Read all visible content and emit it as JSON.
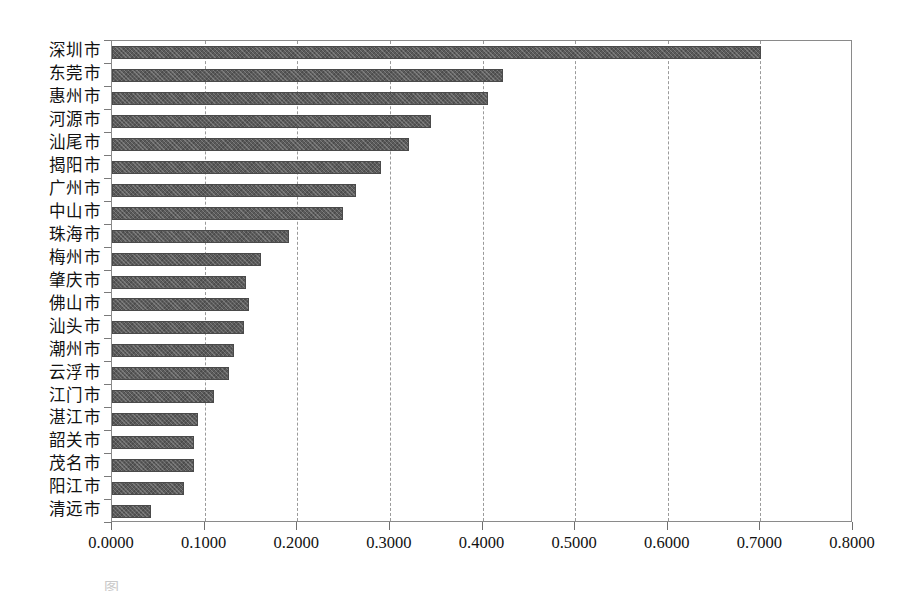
{
  "chart_data": {
    "type": "bar",
    "orientation": "horizontal",
    "title": "",
    "subtitle": "",
    "xlabel": "",
    "ylabel": "",
    "xlim": [
      0.0,
      0.8
    ],
    "xticks": [
      0.0,
      0.1,
      0.2,
      0.3,
      0.4,
      0.5,
      0.6,
      0.7,
      0.8
    ],
    "xtick_labels": [
      "0.0000",
      "0.1000",
      "0.2000",
      "0.3000",
      "0.4000",
      "0.5000",
      "0.6000",
      "0.7000",
      "0.8000"
    ],
    "grid": "vertical-dashed",
    "legend": "none",
    "bar_color": "#5b5b5b",
    "bar_edge_color": "#4a4a4a",
    "frame_color": "#8a8a8a",
    "categories": [
      "深圳市",
      "东莞市",
      "惠州市",
      "河源市",
      "汕尾市",
      "揭阳市",
      "广州市",
      "中山市",
      "珠海市",
      "梅州市",
      "肇庆市",
      "佛山市",
      "汕头市",
      "潮州市",
      "云浮市",
      "江门市",
      "湛江市",
      "韶关市",
      "茂名市",
      "阳江市",
      "清远市"
    ],
    "values": [
      0.701,
      0.4225,
      0.406,
      0.3445,
      0.3205,
      0.2905,
      0.2635,
      0.249,
      0.191,
      0.161,
      0.145,
      0.148,
      0.1425,
      0.132,
      0.126,
      0.11,
      0.093,
      0.088,
      0.088,
      0.0775,
      0.0425
    ],
    "series": [
      {
        "name": "",
        "values": [
          0.701,
          0.4225,
          0.406,
          0.3445,
          0.3205,
          0.2905,
          0.2635,
          0.249,
          0.191,
          0.161,
          0.145,
          0.148,
          0.1425,
          0.132,
          0.126,
          0.11,
          0.093,
          0.088,
          0.088,
          0.0775,
          0.0425
        ]
      }
    ]
  },
  "caption": {
    "text": "图                  ．．．．．．．．．．．．．．．．．．．．．．．．．．"
  }
}
